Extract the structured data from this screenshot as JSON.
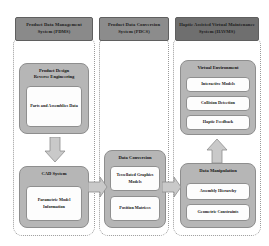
{
  "diagram": {
    "columns": [
      {
        "id": "pdms",
        "header": "Product Data Management System (PDMS)",
        "groups": [
          {
            "id": "product-design-reverse-engineering",
            "title": "Product Design\nReverse Engineering",
            "title_line1": "Product Design",
            "title_line2": "Reverse Engineering",
            "items": [
              {
                "id": "parts-and-assemblies-data",
                "label": "Parts and Assemblies Data"
              }
            ]
          },
          {
            "id": "cad-system",
            "title": "CAD System",
            "title_line1": "CAD System",
            "title_line2": "",
            "items": [
              {
                "id": "parametric-model-information",
                "label": "Parametric Model Information"
              }
            ]
          }
        ]
      },
      {
        "id": "pdcs",
        "header": "Product Data Conversion System (PDCS)",
        "groups": [
          {
            "id": "data-conversion",
            "title": "Data Conversion",
            "title_line1": "Data Conversion",
            "title_line2": "",
            "items": [
              {
                "id": "tessellated-graphics-models",
                "label": "Tessellated Graphics Models"
              },
              {
                "id": "position-matrices",
                "label": "Position Matrices"
              }
            ]
          }
        ]
      },
      {
        "id": "havms",
        "header": "Haptic Assisted Virtual Maintenance System (HAVMS)",
        "groups": [
          {
            "id": "virtual-environment",
            "title": "Virtual Environment",
            "title_line1": "Virtual Environment",
            "title_line2": "",
            "items": [
              {
                "id": "interactive-models",
                "label": "Interactive Models"
              },
              {
                "id": "collision-detection",
                "label": "Collision Detection"
              },
              {
                "id": "haptic-feedback",
                "label": "Haptic Feedback"
              }
            ]
          },
          {
            "id": "data-manipulation",
            "title": "Data Manipulation",
            "title_line1": "Data Manipulation",
            "title_line2": "",
            "items": [
              {
                "id": "assembly-hierarchy",
                "label": "Assembly Hierarchy"
              },
              {
                "id": "geometric-constraints",
                "label": "Geometric Constraints"
              }
            ]
          }
        ]
      }
    ],
    "arrows": [
      {
        "id": "pdre-to-cad",
        "direction": "down",
        "from": "product-design-reverse-engineering",
        "to": "cad-system"
      },
      {
        "id": "cad-to-data-conversion",
        "direction": "right",
        "from": "cad-system",
        "to": "data-conversion"
      },
      {
        "id": "data-conversion-to-data-manipulation",
        "direction": "right",
        "from": "data-conversion",
        "to": "data-manipulation"
      },
      {
        "id": "data-manipulation-to-virtual-environment",
        "direction": "up",
        "from": "data-manipulation",
        "to": "virtual-environment"
      }
    ],
    "colors": {
      "header_fill": "#7d7d7d",
      "group_fill": "#b6b6b6",
      "subbox_fill": "#fdfdfd",
      "arrow_fill": "#c9c9c9",
      "border": "#8e8e8e",
      "background": "#ffffff"
    }
  }
}
